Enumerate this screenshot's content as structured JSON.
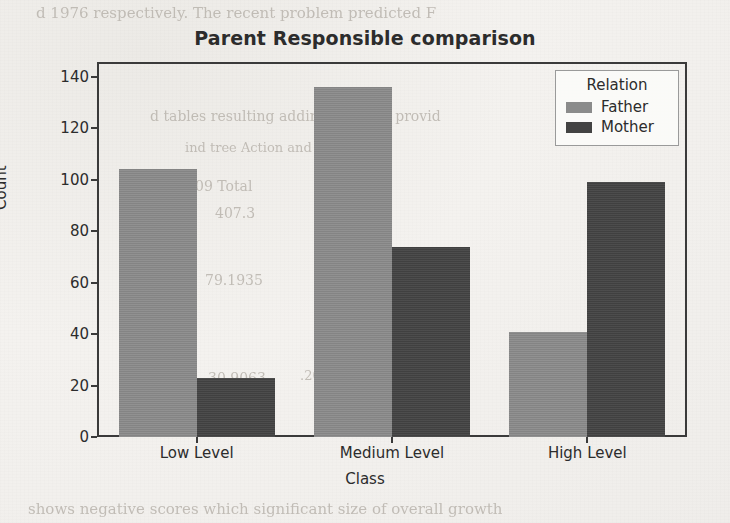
{
  "chart_data": {
    "type": "bar",
    "title": "Parent Responsible comparison",
    "xlabel": "Class",
    "ylabel": "Count",
    "categories": [
      "Low Level",
      "Medium Level",
      "High Level"
    ],
    "series": [
      {
        "name": "Father",
        "color": "#8b8b8b",
        "values": [
          104,
          136,
          41
        ]
      },
      {
        "name": "Mother",
        "color": "#434343",
        "values": [
          23,
          74,
          99
        ]
      }
    ],
    "legend_title": "Relation",
    "legend_position": "upper right",
    "ylim": [
      0,
      145
    ],
    "yticks": [
      0,
      20,
      40,
      60,
      80,
      100,
      120,
      140
    ],
    "ytick_labels": [
      "0",
      "20",
      "40",
      "60",
      "80",
      "100",
      "120",
      "140"
    ],
    "grid": false
  },
  "page_bleed": [
    {
      "text": "d 1976 respectively. The recent problem predicted  F",
      "x": 36,
      "y": 4,
      "size": 15,
      "rot": 0
    },
    {
      "text": "d tables resulting adding the data provid",
      "x": 150,
      "y": 108,
      "size": 14,
      "rot": 0
    },
    {
      "text": "ind           tree       Action  and Function",
      "x": 185,
      "y": 140,
      "size": 13,
      "rot": 0
    },
    {
      "text": "09      Total",
      "x": 195,
      "y": 178,
      "size": 14,
      "rot": 0
    },
    {
      "text": "407.3",
      "x": 215,
      "y": 205,
      "size": 14,
      "rot": 0
    },
    {
      "text": "06.58",
      "x": 330,
      "y": 208,
      "size": 13,
      "rot": 0
    },
    {
      "text": "79.1935",
      "x": 205,
      "y": 272,
      "size": 14,
      "rot": 0
    },
    {
      "text": "Cross",
      "x": 390,
      "y": 272,
      "size": 13,
      "rot": 0
    },
    {
      "text": "30.9063",
      "x": 208,
      "y": 370,
      "size": 14,
      "rot": 0
    },
    {
      "text": ".2088",
      "x": 300,
      "y": 368,
      "size": 13,
      "rot": 0
    },
    {
      "text": "shows negative scores which significant  size of overall growth",
      "x": 28,
      "y": 500,
      "size": 15,
      "rot": 0
    }
  ]
}
